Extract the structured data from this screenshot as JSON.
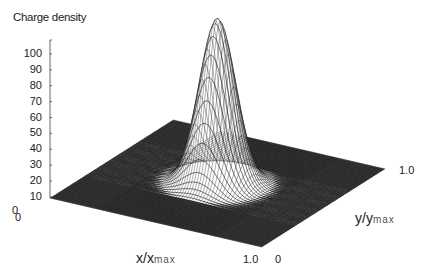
{
  "chart_data": {
    "type": "surface3d",
    "title": "Charge density",
    "xlabel": "x/x",
    "xlabel_sub": "max",
    "ylabel": "y/y",
    "ylabel_sub": "max",
    "zlabel": "Charge density",
    "x_ticks": [
      "0",
      "1.0"
    ],
    "y_ticks": [
      "0",
      "1.0"
    ],
    "z_ticks": [
      "0",
      "10",
      "20",
      "30",
      "40",
      "50",
      "60",
      "70",
      "80",
      "90",
      "100"
    ],
    "zlim": [
      0,
      100
    ],
    "xlim": [
      0,
      1.0
    ],
    "ylim": [
      0,
      1.0
    ],
    "peak": {
      "x": 0.5,
      "y": 0.5,
      "z": 104
    }
  },
  "labels": {
    "title": "Charge density",
    "x_origin": "0",
    "x_end": "1.0",
    "y_origin": "0",
    "y_end": "1.0",
    "z_origin": "0"
  },
  "colors": {
    "mesh": "#1a1a1a",
    "plane": "#3a3a3a",
    "background": "#ffffff"
  }
}
